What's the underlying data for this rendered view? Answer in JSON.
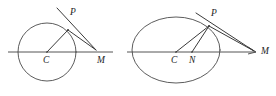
{
  "figure": {
    "background_color": "#ffffff",
    "stroke_color": "#4a4a4a",
    "label_color": "#1d1d1d",
    "width": 276,
    "height": 96,
    "panels": [
      {
        "id": "left-panel",
        "shape": "circle",
        "description": "Circle with center C, tangent at P meeting the axis at M",
        "labels": [
          {
            "key": "P",
            "text": "P",
            "x": 70,
            "y": 8
          },
          {
            "key": "C",
            "text": "C",
            "x": 43,
            "y": 56
          },
          {
            "key": "M",
            "text": "M",
            "x": 97,
            "y": 56
          }
        ]
      },
      {
        "id": "right-panel",
        "shape": "ellipse",
        "description": "Ellipse with center C, focus N, tangent at P meeting the axis at M",
        "labels": [
          {
            "key": "P",
            "text": "P",
            "x": 211,
            "y": 9
          },
          {
            "key": "C",
            "text": "C",
            "x": 171,
            "y": 56
          },
          {
            "key": "N",
            "text": "N",
            "x": 189,
            "y": 56
          },
          {
            "key": "M",
            "text": "M",
            "x": 261,
            "y": 47
          }
        ]
      }
    ]
  }
}
